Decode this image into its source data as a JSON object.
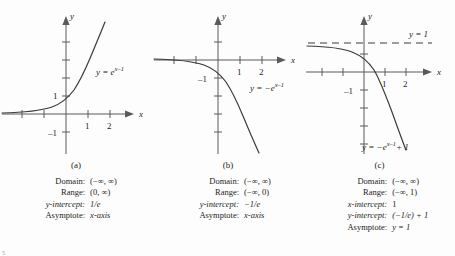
{
  "figure": {
    "corner_mark": "5",
    "panels": [
      {
        "id": "a",
        "caption": "(a)",
        "curve_label_parts": {
          "lhs": "y = e",
          "exponent": "x–1"
        },
        "curve_label_full": "y = e^(x–1)",
        "axes": {
          "x_axis_label": "x",
          "y_axis_label": "y",
          "x_ticks": [
            "1",
            "2"
          ],
          "y_ticks": [
            "1",
            "–1"
          ]
        },
        "facts": [
          {
            "label": "Domain:",
            "value": "(−∞, ∞)"
          },
          {
            "label": "Range:",
            "value": "(0, ∞)"
          },
          {
            "label": "y-intercept:",
            "value": "1/e"
          },
          {
            "label": "Asymptote:",
            "value": "x-axis"
          }
        ]
      },
      {
        "id": "b",
        "caption": "(b)",
        "curve_label_parts": {
          "lhs": "y = −e",
          "exponent": "x–1"
        },
        "curve_label_full": "y = −e^(x–1)",
        "axes": {
          "x_axis_label": "x",
          "y_axis_label": "y",
          "x_ticks": [
            "1",
            "2"
          ],
          "y_ticks": [
            "–1"
          ]
        },
        "facts": [
          {
            "label": "Domain:",
            "value": "(−∞, ∞)"
          },
          {
            "label": "Range:",
            "value": "(−∞, 0)"
          },
          {
            "label": "y-intercept:",
            "value": "−1/e"
          },
          {
            "label": "Asymptote:",
            "value": "x-axis"
          }
        ]
      },
      {
        "id": "c",
        "caption": "(c)",
        "curve_label_parts": {
          "lhs": "y = −e",
          "exponent": "x–1",
          "tail": "+ 1"
        },
        "curve_label_full": "y = −e^(x–1) + 1",
        "asymptote_label": "y = 1",
        "axes": {
          "x_axis_label": "x",
          "y_axis_label": "y",
          "x_ticks": [
            "1",
            "2"
          ],
          "y_ticks": [
            "–1"
          ]
        },
        "facts": [
          {
            "label": "Domain:",
            "value": "(−∞, ∞)"
          },
          {
            "label": "Range:",
            "value": "(−∞, 1)"
          },
          {
            "label": "x-intercept:",
            "value": "1"
          },
          {
            "label": "y-intercept:",
            "value": "(−1/e) + 1"
          },
          {
            "label": "Asymptote:",
            "value": "y = 1"
          }
        ]
      }
    ]
  },
  "colors": {
    "ink": "#231f20",
    "axis": "#5a5a5a",
    "curve": "#3a3a3a",
    "background": "#fdfdfd"
  }
}
